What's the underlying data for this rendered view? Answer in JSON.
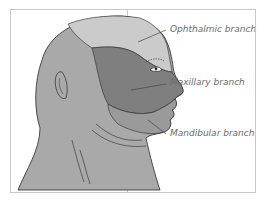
{
  "diagram": {
    "labels": [
      {
        "id": "ophthalmic",
        "text": "Ophthalmic branch"
      },
      {
        "id": "maxillary",
        "text": "Maxillary branch"
      },
      {
        "id": "mandibular",
        "text": "Mandibular branch"
      }
    ],
    "colors": {
      "background": "#ffffff",
      "border": "#c8c8c8",
      "head_base": "#a9a9a9",
      "ophthalmic_region": "#cbcbcb",
      "maxillary_region": "#7f7f7f",
      "mandibular_region": "#9a9a9a",
      "outline": "#2a2a2a",
      "label_text": "#6a6a6a"
    }
  }
}
